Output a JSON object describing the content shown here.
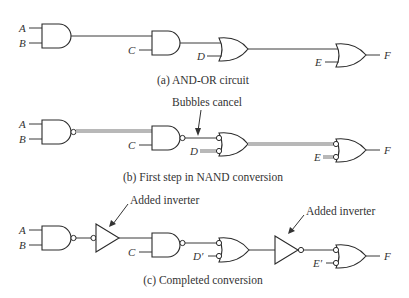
{
  "figure": {
    "panels": [
      {
        "id": "a",
        "caption": "(a) AND-OR circuit",
        "inputs": [
          "A",
          "B",
          "C",
          "D",
          "E"
        ],
        "output": "F",
        "gates": [
          "AND",
          "AND",
          "OR",
          "OR"
        ]
      },
      {
        "id": "b",
        "caption": "(b) First step in NAND conversion",
        "inputs": [
          "A",
          "B",
          "C",
          "D",
          "E"
        ],
        "output": "F",
        "annotation": "Bubbles cancel",
        "gates": [
          "NAND",
          "NAND",
          "OR (inverted inputs)",
          "OR (inverted inputs)"
        ]
      },
      {
        "id": "c",
        "caption": "(c) Completed conversion",
        "inputs": [
          "A",
          "B",
          "C",
          "D'",
          "E'"
        ],
        "output": "F",
        "annotations": [
          "Added inverter",
          "Added inverter"
        ],
        "gates": [
          "NAND",
          "Inverter (input bubble)",
          "NAND",
          "OR (inverted inputs)",
          "Inverter",
          "OR (inverted inputs)"
        ]
      }
    ],
    "labels": {
      "a": {
        "A": "A",
        "B": "B",
        "C": "C",
        "D": "D",
        "E": "E",
        "F": "F"
      },
      "b": {
        "A": "A",
        "B": "B",
        "C": "C",
        "D": "D",
        "E": "E",
        "F": "F",
        "note": "Bubbles cancel"
      },
      "c": {
        "A": "A",
        "B": "B",
        "C": "C",
        "D": "D′",
        "E": "E′",
        "F": "F",
        "note1": "Added inverter",
        "note2": "Added inverter"
      }
    },
    "colors": {
      "line": "#2a2a2a",
      "highlight": "#b8b8b8",
      "background": "#ffffff"
    }
  }
}
